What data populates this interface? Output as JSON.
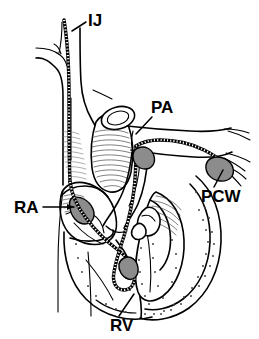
{
  "figure": {
    "kind": "anatomical-line-drawing",
    "background_color": "#ffffff",
    "ink_color": "#000000",
    "shade_color": "#8c8c8c",
    "width": 259,
    "height": 339
  },
  "labels": [
    {
      "id": "ij",
      "text": "IJ",
      "meaning": "internal jugular vein",
      "x": 88,
      "y": 26,
      "leader": "M 86 22 L 72 31"
    },
    {
      "id": "pa",
      "text": "PA",
      "meaning": "pulmonary artery",
      "x": 151,
      "y": 113,
      "leader": "M 150 116 L 136 133"
    },
    {
      "id": "pcw",
      "text": "PCW",
      "meaning": "pulmonary capillary wedge",
      "x": 201,
      "y": 202,
      "leader": "M 214 186 L 222 169"
    },
    {
      "id": "ra",
      "text": "RA",
      "meaning": "right atrium",
      "x": 14,
      "y": 213,
      "leader": "M 43 207 L 73 207"
    },
    {
      "id": "rv",
      "text": "RV",
      "meaning": "right ventricle",
      "x": 110,
      "y": 331,
      "leader": "M 118 315 L 133 295"
    }
  ],
  "catheter": {
    "name": "pulmonary-artery-catheter",
    "style": "segmented-radiopaque",
    "balloon_positions": [
      "pa-bifurcation",
      "pcw-tip",
      "rv-mid",
      "ra-entry"
    ]
  }
}
